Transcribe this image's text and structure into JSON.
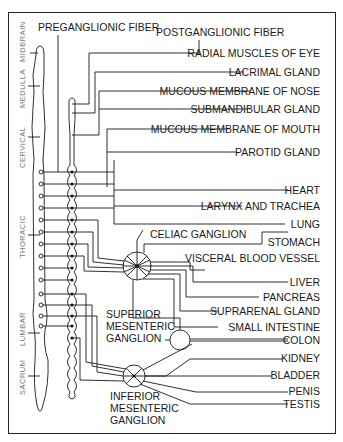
{
  "header": {
    "preganglionic": "PREGANGLIONIC FIBER",
    "postganglionic": "POSTGANGLIONIC FIBER"
  },
  "regions": [
    "MIDBRAIN",
    "MEDULLA",
    "CERVICAL",
    "THORACIC",
    "LUMBAR",
    "SACRUM"
  ],
  "ganglia": {
    "celiac": "CELIAC GANGLION",
    "superior": [
      "SUPERIOR",
      "MESENTERIC",
      "GANGLION"
    ],
    "inferior": [
      "INFERIOR",
      "MESENTERIC",
      "GANGLION"
    ]
  },
  "targets": [
    "RADIAL MUSCLES OF EYE",
    "LACRIMAL GLAND",
    "MUCOUS MEMBRANE OF NOSE",
    "SUBMANDIBULAR GLAND",
    "MUCOUS MEMBRANE OF MOUTH",
    "PAROTID GLAND",
    "HEART",
    "LARYNX AND TRACHEA",
    "LUNG",
    "STOMACH",
    "VISCERAL BLOOD VESSEL",
    "LIVER",
    "PANCREAS",
    "SUPRARENAL GLAND",
    "SMALL INTESTINE",
    "COLON",
    "KIDNEY",
    "BLADDER",
    "PENIS",
    "TESTIS"
  ]
}
